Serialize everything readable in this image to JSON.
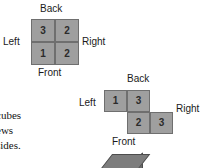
{
  "figure": {
    "background_color": "#ffffff",
    "cell_fill_color": "#9f9f9f",
    "cell_border_color": "#6f6f6f",
    "text_color": "#1a1a1a"
  },
  "diagram_top": {
    "name": "top-plan-view",
    "labels": {
      "back": "Back",
      "front": "Front",
      "left": "Left",
      "right": "Right"
    },
    "cells": [
      {
        "value": "3",
        "row": 0,
        "col": 0
      },
      {
        "value": "2",
        "row": 0,
        "col": 1
      },
      {
        "value": "1",
        "row": 1,
        "col": 0
      },
      {
        "value": "2",
        "row": 1,
        "col": 1
      }
    ]
  },
  "diagram_middle": {
    "name": "offset-plan-view",
    "labels": {
      "back": "Back",
      "front": "Front",
      "left": "Left",
      "right": "Right"
    },
    "cells": [
      {
        "value": "1",
        "row": 0,
        "col": 0
      },
      {
        "value": "3",
        "row": 0,
        "col": 1
      },
      {
        "value": "2",
        "row": 1,
        "col": 1
      },
      {
        "value": "3",
        "row": 1,
        "col": 2
      }
    ]
  },
  "body_text": {
    "line1": "cubes",
    "line2": "ews",
    "line3": "sides."
  }
}
